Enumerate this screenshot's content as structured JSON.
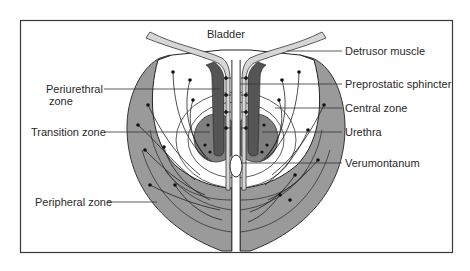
{
  "figure": {
    "title": "Bladder",
    "colors": {
      "background": "#ffffff",
      "frame": "#3a3a3a",
      "peripheral": "#9a9a9a",
      "transition": "#7f7f7f",
      "sphincter": "#555555",
      "detrusor": "#d6d6d6",
      "duct_line": "#222222",
      "label_text": "#2a2a2a"
    },
    "labels_left": [
      {
        "id": "periurethral",
        "line1": "Periurethral",
        "line2": "zone"
      },
      {
        "id": "transition",
        "text": "Transition zone"
      },
      {
        "id": "peripheral",
        "text": "Peripheral zone"
      }
    ],
    "labels_right": [
      {
        "id": "detrusor",
        "text": "Detrusor muscle"
      },
      {
        "id": "preprostatic",
        "text": "Preprostatic sphincter"
      },
      {
        "id": "central",
        "text": "Central zone"
      },
      {
        "id": "urethra",
        "text": "Urethra"
      },
      {
        "id": "verumontanum",
        "text": "Verumontanum"
      }
    ]
  }
}
